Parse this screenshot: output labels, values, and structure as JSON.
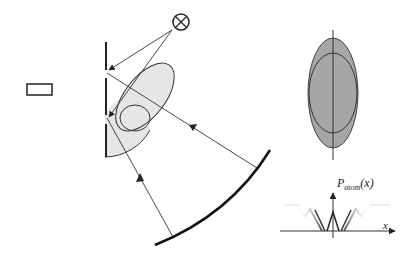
{
  "diagram": {
    "title": "",
    "labels": {
      "p_main": "P",
      "p_sub": "atom",
      "p_arg": "(x)",
      "x_axis": "x"
    },
    "elements": {
      "source_symbol": "otimes-cross-circle",
      "small_rectangle": "rectangle",
      "flat_mirror": "vertical-segmented-mirror",
      "curved_mirror": "concave-mirror-arc",
      "tilted_ellipse": "shaded-ellipse",
      "small_ellipse": "outline-ellipse",
      "vertical_ellipse_outer": "dark-gray-ellipse",
      "vertical_ellipse_inner": "outline-ellipse",
      "probability_plot": "P_atom(x) vs x"
    },
    "colors": {
      "line": "#222222",
      "light_fill": "#e6e6e6",
      "dark_fill": "#a6a6a6",
      "background": "#ffffff"
    }
  }
}
